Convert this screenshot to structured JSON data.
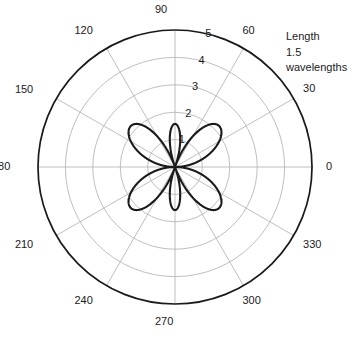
{
  "figure": {
    "title": "",
    "background_color": "#ffffff",
    "outer_circle_color": "#1a1a1a",
    "grid_color": "#b4b4b4",
    "curve_color": "#1a1a1a"
  },
  "annotation": {
    "line1": "Length",
    "line2": "1.5",
    "line3": "wavelengths"
  },
  "angle_labels": [
    {
      "text": "0",
      "deg": 0
    },
    {
      "text": "30",
      "deg": 30
    },
    {
      "text": "60",
      "deg": 60
    },
    {
      "text": "90",
      "deg": 90
    },
    {
      "text": "120",
      "deg": 120
    },
    {
      "text": "150",
      "deg": 150
    },
    {
      "text": "180",
      "deg": 180
    },
    {
      "text": "210",
      "deg": 210
    },
    {
      "text": "240",
      "deg": 240
    },
    {
      "text": "270",
      "deg": 270
    },
    {
      "text": "300",
      "deg": 300
    },
    {
      "text": "330",
      "deg": 330
    }
  ],
  "radial_labels": [
    {
      "text": "1",
      "r": 1
    },
    {
      "text": "2",
      "r": 2
    },
    {
      "text": "3",
      "r": 3
    },
    {
      "text": "4",
      "r": 4
    },
    {
      "text": "5",
      "r": 5
    }
  ],
  "chart_data": {
    "type": "line",
    "subtype": "polar",
    "title": "",
    "xlabel": "",
    "ylabel": "",
    "rlim": [
      0,
      5
    ],
    "rticks": [
      1,
      2,
      3,
      4,
      5
    ],
    "thetaticks": [
      0,
      30,
      60,
      90,
      120,
      150,
      180,
      210,
      240,
      270,
      300,
      330
    ],
    "theta_unit": "degrees",
    "theta_direction": "counterclockwise",
    "theta_zero_location": "E",
    "grid": true,
    "legend": false,
    "annotations": [
      "Length",
      "1.5",
      "wavelengths"
    ],
    "series": [
      {
        "name": "1.5 wavelength dipole radiation pattern",
        "description": "Six-lobe pattern: four major lobes and two minor lobes along the 90/270 axis",
        "formula": "r(theta) = 2.2 * |cos(1.5*pi*cos(theta)) / sin(theta)| / 1.0",
        "peak_value": 2.2,
        "minor_lobe_peak": 1.45,
        "lobe_peak_angles_deg": [
          42.5,
          90,
          137.5,
          222.5,
          270,
          317.5
        ],
        "nulls_deg": [
          0,
          70.5,
          109.5,
          180,
          250.5,
          289.5
        ],
        "theta_deg": [
          0,
          5,
          10,
          15,
          20,
          25,
          30,
          35,
          40,
          42.5,
          45,
          50,
          55,
          60,
          65,
          70.5,
          75,
          80,
          85,
          90,
          95,
          100,
          105,
          109.5,
          115,
          120,
          125,
          130,
          135,
          137.5,
          140,
          145,
          150,
          155,
          160,
          165,
          170,
          175,
          180
        ],
        "r_values": [
          0,
          0.07,
          0.27,
          0.59,
          1.01,
          1.46,
          1.85,
          2.09,
          2.19,
          2.2,
          2.17,
          1.96,
          1.58,
          1.11,
          0.58,
          0.0,
          0.55,
          1.06,
          1.38,
          1.45,
          1.38,
          1.06,
          0.55,
          0.0,
          0.66,
          1.11,
          1.58,
          1.96,
          2.17,
          2.2,
          2.19,
          2.09,
          1.85,
          1.46,
          1.01,
          0.59,
          0.27,
          0.07,
          0
        ]
      }
    ]
  }
}
